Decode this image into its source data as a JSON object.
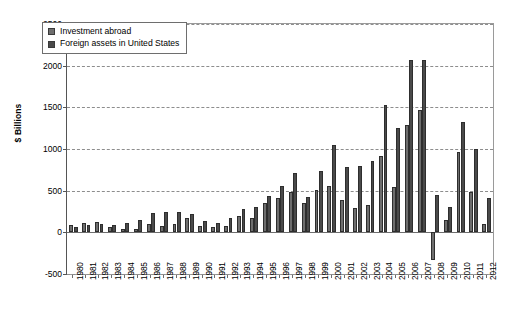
{
  "chart_data": {
    "type": "bar",
    "title": "",
    "subtitle": "",
    "xlabel": "",
    "ylabel": "$ Billions",
    "ylim": [
      -500,
      2500
    ],
    "yticks": [
      -500,
      0,
      500,
      1000,
      1500,
      2000,
      2500
    ],
    "ytick_labels": [
      "-500",
      "0",
      "500",
      "1000",
      "1500",
      "2000",
      "2500"
    ],
    "grid": true,
    "grid_style": "dashed-horizontal",
    "legend_position": "upper-left-inside",
    "categories": [
      "1980",
      "1981",
      "1982",
      "1983",
      "1984",
      "1985",
      "1986",
      "1987",
      "1988",
      "1989",
      "1990",
      "1991",
      "1992",
      "1993",
      "1994",
      "1995",
      "1996",
      "1997",
      "1998",
      "1999",
      "2000",
      "2001",
      "2002",
      "2003",
      "2004",
      "2005",
      "2006",
      "2007",
      "2008",
      "2009",
      "2010",
      "2011",
      "2012"
    ],
    "series": [
      {
        "name": "Investment abroad",
        "color": "#6e6e6e",
        "values": [
          86,
          114,
          128,
          66,
          40,
          44,
          98,
          80,
          102,
          169,
          81,
          64,
          74,
          201,
          178,
          352,
          413,
          488,
          353,
          504,
          561,
          383,
          294,
          325,
          912,
          546,
          1285,
          1474,
          -332,
          149,
          966,
          484,
          97
        ]
      },
      {
        "name": "Foreign assets in United States",
        "color": "#4a4a4a",
        "values": [
          62,
          84,
          96,
          88,
          117,
          146,
          230,
          248,
          246,
          224,
          141,
          111,
          171,
          282,
          306,
          438,
          551,
          707,
          423,
          742,
          1047,
          783,
          795,
          858,
          1533,
          1247,
          2065,
          2065,
          454,
          306,
          1325,
          999,
          417
        ]
      }
    ]
  },
  "legend": {
    "entries": [
      {
        "label": "Investment abroad"
      },
      {
        "label": "Foreign assets in United States"
      }
    ]
  }
}
